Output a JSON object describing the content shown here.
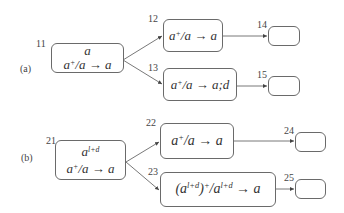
{
  "diagram": {
    "type": "state-transition-trees",
    "edge_color": "#555555",
    "node_border_color": "#6a6a6a",
    "parts": [
      {
        "label": "(a)",
        "nodes": [
          {
            "id": "11",
            "num": "11",
            "lines": [
              {
                "base": "a",
                "sup": ""
              },
              {
                "text_parts": [
                  "a",
                  "+",
                  "/a ",
                  "→",
                  " a"
                ]
              }
            ]
          },
          {
            "id": "12",
            "num": "12",
            "rule": {
              "text_parts": [
                "a",
                "+",
                "/a ",
                "→",
                " a"
              ]
            }
          },
          {
            "id": "13",
            "num": "13",
            "rule": {
              "text_parts": [
                "a",
                "+",
                "/a ",
                "→",
                " a;d"
              ]
            }
          },
          {
            "id": "14",
            "num": "14",
            "empty": true
          },
          {
            "id": "15",
            "num": "15",
            "empty": true
          }
        ],
        "edges": [
          [
            "11",
            "12"
          ],
          [
            "11",
            "13"
          ],
          [
            "12",
            "14"
          ],
          [
            "13",
            "15"
          ]
        ]
      },
      {
        "label": "(b)",
        "nodes": [
          {
            "id": "21",
            "num": "21",
            "lines": [
              {
                "base": "a",
                "sup": "l+d"
              },
              {
                "text_parts": [
                  "a",
                  "+",
                  "/a ",
                  "→",
                  " a"
                ]
              }
            ]
          },
          {
            "id": "22",
            "num": "22",
            "rule": {
              "text_parts": [
                "a",
                "+",
                "/a ",
                "→",
                " a"
              ]
            }
          },
          {
            "id": "23",
            "num": "23",
            "rule": {
              "text": "(a^(l+d))^+/a^(l+d) → a",
              "parts": [
                "(a",
                "l+d",
                ")",
                "+",
                "/a",
                "l+d",
                " ",
                "→",
                " a"
              ]
            }
          },
          {
            "id": "24",
            "num": "24",
            "empty": true
          },
          {
            "id": "25",
            "num": "25",
            "empty": true
          }
        ],
        "edges": [
          [
            "21",
            "22"
          ],
          [
            "21",
            "23"
          ],
          [
            "22",
            "24"
          ],
          [
            "23",
            "25"
          ]
        ]
      }
    ]
  }
}
